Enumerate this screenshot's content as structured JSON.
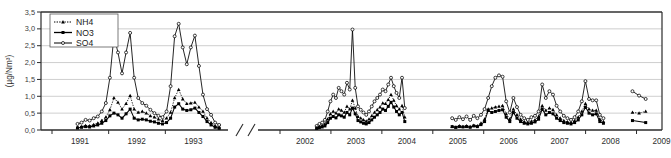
{
  "chart_data": {
    "type": "line",
    "title": "",
    "xlabel": "",
    "ylabel": "(µg/Nm³)",
    "ylim": [
      0.0,
      3.5
    ],
    "ytick_labels": [
      "0,0",
      "0,5",
      "1,0",
      "1,5",
      "2,0",
      "2,5",
      "3,0",
      "3,5"
    ],
    "ytick_values": [
      0.0,
      0.5,
      1.0,
      1.5,
      2.0,
      2.5,
      3.0,
      3.5
    ],
    "xtick_labels": [
      "1991",
      "1992",
      "1993",
      "2002",
      "2003",
      "2004",
      "2005",
      "2006",
      "2007",
      "2008",
      "2009"
    ],
    "grid": "horizontal",
    "axis_break": true,
    "axis_break_label": "//",
    "legend_position": "top-left",
    "legend_entries": [
      {
        "name": "NH4",
        "line_style": "dotted",
        "marker": "triangle-filled",
        "color": "#000000"
      },
      {
        "name": "NO3",
        "line_style": "solid",
        "marker": "square-filled",
        "color": "#000000"
      },
      {
        "name": "SO4",
        "line_style": "solid",
        "marker": "circle-open",
        "color": "#000000"
      }
    ],
    "segments": [
      {
        "label": "1991-1993",
        "x_start": 1991.45,
        "x_end": 1993.95,
        "series": [
          {
            "name": "SO4",
            "values": [
              0.18,
              0.22,
              0.3,
              0.28,
              0.35,
              0.4,
              0.55,
              0.8,
              1.55,
              2.78,
              2.3,
              1.68,
              2.3,
              2.88,
              1.55,
              0.95,
              0.8,
              0.72,
              0.6,
              0.5,
              0.42,
              0.38,
              0.55,
              1.3,
              2.78,
              3.15,
              2.45,
              1.95,
              2.45,
              2.8,
              1.9,
              1.05,
              0.62,
              0.45,
              0.22,
              0.15
            ]
          },
          {
            "name": "NH4",
            "values": [
              0.08,
              0.1,
              0.13,
              0.12,
              0.16,
              0.2,
              0.28,
              0.38,
              0.6,
              0.95,
              0.82,
              0.62,
              0.78,
              1.02,
              0.62,
              0.52,
              0.55,
              0.5,
              0.42,
              0.38,
              0.32,
              0.28,
              0.35,
              0.52,
              0.95,
              1.2,
              0.92,
              0.78,
              0.8,
              0.82,
              0.68,
              0.55,
              0.35,
              0.22,
              0.12,
              0.08
            ]
          },
          {
            "name": "NO3",
            "values": [
              0.06,
              0.08,
              0.1,
              0.09,
              0.12,
              0.15,
              0.2,
              0.28,
              0.42,
              0.5,
              0.45,
              0.35,
              0.48,
              0.62,
              0.35,
              0.3,
              0.32,
              0.3,
              0.26,
              0.24,
              0.2,
              0.18,
              0.22,
              0.35,
              0.68,
              0.78,
              0.62,
              0.58,
              0.6,
              0.65,
              0.52,
              0.4,
              0.25,
              0.15,
              0.08,
              0.05
            ]
          }
        ]
      },
      {
        "label": "2002-2004",
        "x_start": 2002.72,
        "x_end": 2004.45,
        "series": [
          {
            "name": "SO4",
            "values": [
              0.12,
              0.18,
              0.22,
              0.3,
              0.55,
              0.85,
              1.05,
              0.95,
              1.25,
              1.15,
              1.05,
              1.4,
              1.2,
              2.98,
              1.25,
              0.7,
              0.6,
              0.52,
              0.45,
              0.55,
              0.7,
              0.85,
              0.95,
              1.05,
              1.2,
              1.15,
              1.35,
              1.55,
              1.3,
              1.1,
              0.95,
              1.55,
              0.65
            ]
          },
          {
            "name": "NH4",
            "values": [
              0.06,
              0.1,
              0.13,
              0.18,
              0.32,
              0.48,
              0.55,
              0.5,
              0.62,
              0.58,
              0.52,
              0.7,
              0.62,
              0.88,
              0.65,
              0.4,
              0.35,
              0.3,
              0.26,
              0.32,
              0.42,
              0.52,
              0.6,
              0.68,
              0.8,
              0.78,
              0.9,
              1.05,
              0.88,
              0.72,
              0.62,
              0.72,
              0.38
            ]
          },
          {
            "name": "NO3",
            "values": [
              0.05,
              0.07,
              0.09,
              0.12,
              0.22,
              0.35,
              0.4,
              0.36,
              0.45,
              0.42,
              0.38,
              0.52,
              0.45,
              0.65,
              0.48,
              0.28,
              0.24,
              0.2,
              0.18,
              0.22,
              0.3,
              0.38,
              0.45,
              0.52,
              0.62,
              0.58,
              0.7,
              0.82,
              0.68,
              0.55,
              0.45,
              0.52,
              0.25
            ]
          }
        ]
      },
      {
        "label": "2005-2008",
        "x_start": 2005.38,
        "x_end": 2008.35,
        "series": [
          {
            "name": "SO4",
            "values": [
              0.35,
              0.3,
              0.38,
              0.32,
              0.4,
              0.3,
              0.42,
              0.35,
              0.45,
              0.62,
              0.95,
              1.3,
              1.55,
              1.62,
              1.58,
              0.85,
              0.52,
              0.95,
              0.68,
              0.45,
              0.35,
              0.3,
              0.38,
              0.42,
              0.55,
              1.35,
              0.95,
              1.15,
              1.05,
              0.72,
              0.55,
              0.42,
              0.35,
              0.3,
              0.38,
              0.55,
              0.85,
              1.45,
              0.92,
              0.88,
              0.88,
              0.45,
              0.35
            ]
          },
          {
            "name": "NH4",
            "values": [
              0.1,
              0.08,
              0.12,
              0.1,
              0.12,
              0.1,
              0.14,
              0.12,
              0.2,
              0.32,
              0.62,
              0.65,
              0.68,
              0.7,
              0.72,
              0.48,
              0.32,
              0.62,
              0.45,
              0.32,
              0.25,
              0.22,
              0.26,
              0.3,
              0.4,
              0.72,
              0.58,
              0.65,
              0.6,
              0.45,
              0.35,
              0.28,
              0.24,
              0.22,
              0.28,
              0.38,
              0.55,
              0.78,
              0.62,
              0.58,
              0.58,
              0.32,
              0.25
            ]
          },
          {
            "name": "NO3",
            "values": [
              0.1,
              0.08,
              0.1,
              0.09,
              0.1,
              0.08,
              0.12,
              0.1,
              0.16,
              0.25,
              0.58,
              0.52,
              0.55,
              0.58,
              0.6,
              0.38,
              0.25,
              0.52,
              0.35,
              0.25,
              0.2,
              0.18,
              0.2,
              0.24,
              0.32,
              0.62,
              0.45,
              0.52,
              0.48,
              0.35,
              0.28,
              0.22,
              0.2,
              0.18,
              0.22,
              0.3,
              0.45,
              0.68,
              0.5,
              0.45,
              0.48,
              0.25,
              0.2
            ]
          }
        ]
      },
      {
        "label": "2009",
        "x_start": 2008.92,
        "x_end": 2009.18,
        "series": [
          {
            "name": "SO4",
            "values": [
              1.15,
              1.02,
              0.92
            ]
          },
          {
            "name": "NH4",
            "values": [
              0.52,
              0.5,
              0.55
            ]
          },
          {
            "name": "NO3",
            "values": [
              0.28,
              0.22
            ]
          }
        ]
      }
    ]
  }
}
